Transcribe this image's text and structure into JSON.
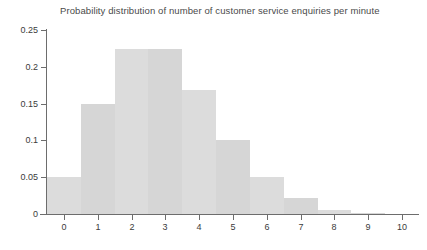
{
  "chart_data": {
    "type": "bar",
    "title": "Probability distribution of number of customer service enquiries per minute",
    "xlabel": "",
    "ylabel": "",
    "categories": [
      "0",
      "1",
      "2",
      "3",
      "4",
      "5",
      "6",
      "7",
      "8",
      "9",
      "10"
    ],
    "values": [
      0.05,
      0.149,
      0.224,
      0.224,
      0.168,
      0.1,
      0.05,
      0.022,
      0.006,
      0.001,
      0.0
    ],
    "xlim": [
      -0.5,
      10.5
    ],
    "ylim": [
      0,
      0.25
    ],
    "y_ticks": [
      0,
      0.05,
      0.1,
      0.15,
      0.2,
      0.25
    ],
    "y_tick_labels": [
      "0",
      "0.05",
      "0.1",
      "0.15",
      "0.2",
      "0.25"
    ],
    "x_ticks": [
      0,
      1,
      2,
      3,
      4,
      5,
      6,
      7,
      8,
      9,
      10
    ],
    "x_tick_labels": [
      "0",
      "1",
      "2",
      "3",
      "4",
      "5",
      "6",
      "7",
      "8",
      "9",
      "10"
    ],
    "grid": false,
    "legend": false,
    "bar_color": "#dcdcdc",
    "bar_color_alt": "#d6d6d6",
    "axis_color": "#6d6d6d",
    "text_color": "#3b3b3b"
  }
}
